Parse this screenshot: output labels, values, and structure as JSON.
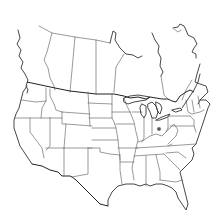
{
  "map": {
    "title": "",
    "region": "United States and southern Canada",
    "style": "outline",
    "background_color": "#ffffff",
    "border_color": "#6e6e6e",
    "coast_color": "#333333",
    "markers": [
      {
        "id": "marker-1",
        "location": "Ohio",
        "x": 159,
        "y": 129,
        "color": "#555555"
      }
    ]
  }
}
